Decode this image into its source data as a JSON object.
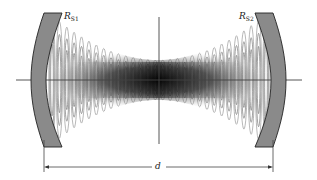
{
  "diagram": {
    "labels": {
      "mirror1": {
        "symbol": "R",
        "subscript": "S1"
      },
      "mirror2": {
        "symbol": "R",
        "subscript": "S2"
      },
      "distance": "d"
    },
    "colors": {
      "mirror_fill": "#8a8a8a",
      "mirror_stroke": "#222222",
      "axis": "#444444",
      "fringe": "#9a9a9a",
      "background": "#ffffff"
    },
    "fringe_count": 30
  }
}
